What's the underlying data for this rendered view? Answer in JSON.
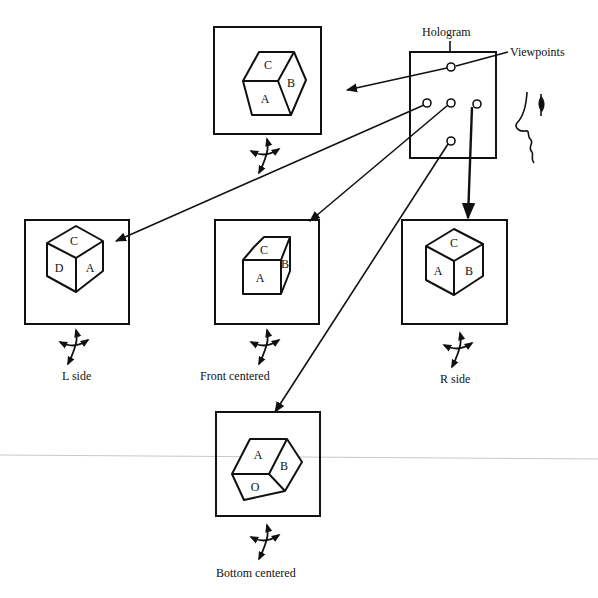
{
  "diagram": {
    "hologram": {
      "label": "Hologram",
      "viewpoints_label": "Viewpoints",
      "viewpoint_count": 5
    },
    "views": [
      {
        "id": "top",
        "caption": "",
        "faces": {
          "top": "C",
          "right": "B",
          "front": "A"
        }
      },
      {
        "id": "l-side",
        "caption": "L side",
        "faces": {
          "top": "C",
          "left": "D",
          "right": "A"
        }
      },
      {
        "id": "front-centered",
        "caption": "Front centered",
        "faces": {
          "top": "C",
          "front": "A",
          "right": "B"
        }
      },
      {
        "id": "r-side",
        "caption": "R side",
        "faces": {
          "top": "C",
          "left": "A",
          "right": "B"
        }
      },
      {
        "id": "bottom-centered",
        "caption": "Bottom centered",
        "faces": {
          "top": "A",
          "right": "B",
          "bottom": "O"
        }
      }
    ],
    "colors": {
      "ink": "#111111",
      "background": "#ffffff",
      "rule": "#bdbdbd"
    }
  }
}
